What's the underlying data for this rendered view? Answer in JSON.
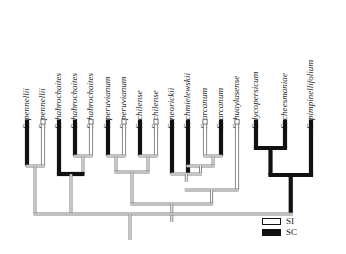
{
  "figure": {
    "type": "phylogenetic-cladogram",
    "width": 346,
    "height": 254,
    "background_color": "#ffffff",
    "branch_outline_color": "#808080",
    "sc_fill_color": "#111111",
    "si_fill_color": "#ffffff"
  },
  "legend": {
    "position": "bottom-right",
    "items": [
      {
        "key": "SI",
        "label": "SI",
        "swatch": "white-rectangle",
        "meaning_code": "SI"
      },
      {
        "key": "SC",
        "label": "SC",
        "swatch": "black-rectangle",
        "meaning_code": "SC"
      }
    ]
  },
  "taxa": [
    {
      "index": 0,
      "label": "S. pennellii",
      "state": "SC",
      "x": 27
    },
    {
      "index": 1,
      "label": "S. pennellii",
      "state": "SI",
      "x": 43
    },
    {
      "index": 2,
      "label": "S. habrochaites",
      "state": "SC",
      "x": 59
    },
    {
      "index": 3,
      "label": "S. habrochaites",
      "state": "SC",
      "x": 75
    },
    {
      "index": 4,
      "label": "S. habrochaites",
      "state": "SI",
      "x": 91
    },
    {
      "index": 5,
      "label": "S. peruvianum",
      "state": "SC",
      "x": 108
    },
    {
      "index": 6,
      "label": "S. peruvianum",
      "state": "SI",
      "x": 124
    },
    {
      "index": 7,
      "label": "S. chilense",
      "state": "SC",
      "x": 140
    },
    {
      "index": 8,
      "label": "S. chilense",
      "state": "SI",
      "x": 156
    },
    {
      "index": 9,
      "label": "S. neorickii",
      "state": "SC",
      "x": 172
    },
    {
      "index": 10,
      "label": "S. chmielewskii",
      "state": "SC",
      "x": 188
    },
    {
      "index": 11,
      "label": "S. arcanum",
      "state": "SI",
      "x": 205
    },
    {
      "index": 12,
      "label": "S. arcanum",
      "state": "SC",
      "x": 221
    },
    {
      "index": 13,
      "label": "S. huaylasense",
      "state": "SI",
      "x": 237
    },
    {
      "index": 14,
      "label": "S. lycopersicum",
      "state": "SC",
      "x": 256
    },
    {
      "index": 15,
      "label": "S. cheesmaniae",
      "state": "SC",
      "x": 285
    },
    {
      "index": 16,
      "label": "S. pimpinellifolium",
      "state": "SC",
      "x": 311
    }
  ],
  "chart_data": {
    "type": "cladogram",
    "title": "",
    "tip_count": 17,
    "character": "mating system",
    "character_states": [
      "SI",
      "SC"
    ],
    "tip_states": [
      "SC",
      "SI",
      "SC",
      "SC",
      "SI",
      "SC",
      "SI",
      "SC",
      "SI",
      "SC",
      "SC",
      "SI",
      "SC",
      "SI",
      "SC",
      "SC",
      "SC"
    ],
    "tip_labels": [
      "S. pennellii",
      "S. pennellii",
      "S. habrochaites",
      "S. habrochaites",
      "S. habrochaites",
      "S. peruvianum",
      "S. peruvianum",
      "S. chilense",
      "S. chilense",
      "S. neorickii",
      "S. chmielewskii",
      "S. arcanum",
      "S. arcanum",
      "S. huaylasense",
      "S. lycopersicum",
      "S. cheesmaniae",
      "S. pimpinellifolium"
    ],
    "clades": [
      {
        "name": "pennellii-clade",
        "tips": [
          0,
          1
        ],
        "state": "SI"
      },
      {
        "name": "habrochaites-pair",
        "tips": [
          3,
          4
        ],
        "state": "SI"
      },
      {
        "name": "habrochaites-clade",
        "tips": [
          2,
          3,
          4
        ],
        "state": "SC"
      },
      {
        "name": "peruvianum-pair",
        "tips": [
          5,
          6
        ],
        "state": "SI"
      },
      {
        "name": "chilense-pair",
        "tips": [
          7,
          8
        ],
        "state": "SI"
      },
      {
        "name": "peruvianum-chilense",
        "tips": [
          5,
          6,
          7,
          8
        ],
        "state": "SI"
      },
      {
        "name": "arcanum-pair",
        "tips": [
          11,
          12
        ],
        "state": "SI"
      },
      {
        "name": "arcanum-chmiel",
        "tips": [
          10,
          11,
          12
        ],
        "state": "SI"
      },
      {
        "name": "neorickii-group",
        "tips": [
          9,
          10,
          11,
          12
        ],
        "state": "SI"
      },
      {
        "name": "huaylasense-group",
        "tips": [
          9,
          10,
          11,
          12,
          13
        ],
        "state": "SI"
      },
      {
        "name": "esculentum-clade",
        "tips": [
          14,
          15,
          16
        ],
        "state": "SC"
      }
    ],
    "legend_entries": [
      "SI",
      "SC"
    ],
    "legend_position": "bottom-right"
  }
}
